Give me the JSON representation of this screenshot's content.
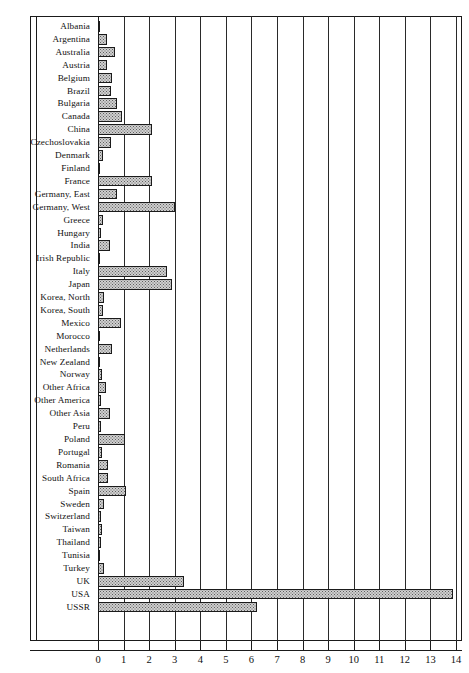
{
  "chart_data": {
    "type": "bar",
    "orientation": "horizontal",
    "title": "",
    "xlabel": "",
    "ylabel": "",
    "xlim": [
      0,
      14
    ],
    "xticks": [
      "0",
      "1",
      "2",
      "3",
      "4",
      "5",
      "6",
      "7",
      "8",
      "9",
      "10",
      "11",
      "12",
      "13",
      "14"
    ],
    "grid": "vertical gridlines at every integer tick",
    "legend": "none",
    "bar_style": {
      "fill": "#cfcfcf",
      "pattern": "stipple-halftone",
      "outline": "#1b1b1b"
    },
    "categories": [
      "Albania",
      "Argentina",
      "Australia",
      "Austria",
      "Belgium",
      "Brazil",
      "Bulgaria",
      "Canada",
      "China",
      "Czechoslovakia",
      "Denmark",
      "Finland",
      "France",
      "Germany, East",
      "Germany, West",
      "Greece",
      "Hungary",
      "India",
      "Irish Republic",
      "Italy",
      "Japan",
      "Korea, North",
      "Korea, South",
      "Mexico",
      "Morocco",
      "Netherlands",
      "New Zealand",
      "Norway",
      "Other Africa",
      "Other America",
      "Other  Asia",
      "Peru",
      "Poland",
      "Portugal",
      "Romania",
      "South Africa",
      "Spain",
      "Sweden",
      "Switzerland",
      "Taiwan",
      "Thailand",
      "Tunisia",
      "Turkey",
      "UK",
      "USA",
      "USSR"
    ],
    "values": [
      0.05,
      0.35,
      0.65,
      0.35,
      0.55,
      0.5,
      0.75,
      0.95,
      2.1,
      0.5,
      0.2,
      0.08,
      2.1,
      0.75,
      3.0,
      0.2,
      0.1,
      0.45,
      0.03,
      2.7,
      2.9,
      0.25,
      0.2,
      0.9,
      0.07,
      0.55,
      0.08,
      0.15,
      0.3,
      0.12,
      0.45,
      0.1,
      1.05,
      0.15,
      0.4,
      0.4,
      1.1,
      0.25,
      0.12,
      0.14,
      0.1,
      0.05,
      0.22,
      3.35,
      13.9,
      6.2
    ]
  },
  "axis": {
    "ticks": [
      "0",
      "1",
      "2",
      "3",
      "4",
      "5",
      "6",
      "7",
      "8",
      "9",
      "10",
      "11",
      "12",
      "13",
      "14"
    ]
  }
}
